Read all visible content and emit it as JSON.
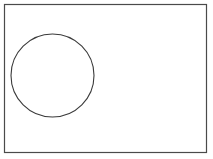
{
  "figure": {
    "canvas": {
      "width": 213,
      "height": 159,
      "background_color": "#ffffff"
    },
    "style": {
      "stroke_color": "#4a4a4a",
      "circle_stroke_color": "#3a3a3a",
      "fill_color": "none",
      "stroke_width": 1.2,
      "circle_stroke_width": 1.1
    },
    "shapes": [
      {
        "name": "rectangle",
        "kind": "rect",
        "x": 4.5,
        "y": 4.5,
        "width": 202,
        "height": 148,
        "stroke": "#4a4a4a",
        "stroke_width": 1.2,
        "fill": "none"
      },
      {
        "name": "circle",
        "kind": "circle",
        "cx": 52.5,
        "cy": 75.5,
        "r": 41.5,
        "stroke": "#3a3a3a",
        "stroke_width": 1.1,
        "fill": "none"
      }
    ],
    "labels": []
  }
}
